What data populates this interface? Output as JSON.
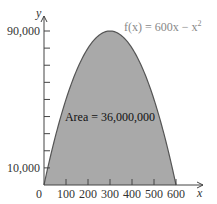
{
  "chart_data": {
    "type": "area",
    "title": "",
    "function_label": "f(x) = 600x − x²",
    "function_label_parts": {
      "prefix": "f(x) = 600x − x",
      "exponent": "2"
    },
    "annotation": "Area = 36,000,000",
    "xlabel": "x",
    "ylabel": "y",
    "xlim": [
      0,
      600
    ],
    "ylim": [
      0,
      90000
    ],
    "x_ticks": [
      0,
      100,
      200,
      300,
      400,
      500,
      600
    ],
    "x_tick_labels": [
      "0",
      "100",
      "200",
      "300",
      "400",
      "500",
      "600"
    ],
    "y_ticks": [
      10000,
      20000,
      30000,
      40000,
      50000,
      60000,
      70000,
      80000,
      90000
    ],
    "y_tick_labels_shown": {
      "10000": "10,000",
      "90000": "90,000"
    },
    "x": [
      0,
      50,
      100,
      150,
      200,
      250,
      300,
      350,
      400,
      450,
      500,
      550,
      600
    ],
    "values": [
      0,
      27500,
      50000,
      67500,
      80000,
      87500,
      90000,
      87500,
      80000,
      67500,
      50000,
      27500,
      0
    ],
    "fill_color": "#a9a9a9",
    "curve_color": "#555555",
    "grid": false,
    "legend": "none"
  },
  "labels": {
    "y_top": "90,000",
    "y_bottom": "10,000",
    "x_origin": "0"
  }
}
